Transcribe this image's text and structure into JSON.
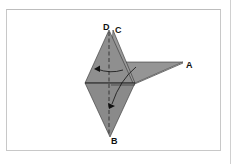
{
  "diagram": {
    "type": "origami-fold-step",
    "labels": {
      "d": "D",
      "c": "C",
      "a": "A",
      "b": "B"
    },
    "colors": {
      "paper": "#8c8c8c",
      "paper_light": "#9a9a9a",
      "line": "#222222",
      "frame": "#c8c8c8",
      "background": "#ffffff"
    },
    "arrows": [
      {
        "name": "fold-left-arrow",
        "direction": "left"
      },
      {
        "name": "fold-down-arrow",
        "direction": "down"
      }
    ]
  }
}
